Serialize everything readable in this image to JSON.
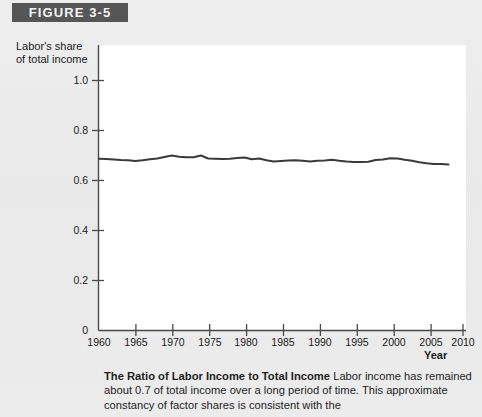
{
  "figure": {
    "banner_label": "FIGURE 3-5"
  },
  "axes": {
    "y_title_line1": "Labor's share",
    "y_title_line2": "of total income",
    "x_title": "Year",
    "y_ticks": [
      "1.0",
      "0.8",
      "0.6",
      "0.4",
      "0.2",
      "0"
    ],
    "x_ticks": [
      "1960",
      "1965",
      "1970",
      "1975",
      "1980",
      "1985",
      "1990",
      "1995",
      "2000",
      "2005",
      "2010"
    ]
  },
  "caption": {
    "title": "The Ratio of Labor Income to Total Income",
    "body": "Labor income has remained about 0.7 of total income over a long period of time. This approximate constancy of factor shares is consistent with the"
  },
  "colors": {
    "banner_bg": "#565656",
    "banner_text": "#f4f4f4",
    "page_bg": "#ebebeb",
    "plot_bg": "#ffffff",
    "line": "#3a3a3a",
    "axis": "#4a4a4a"
  },
  "chart_data": {
    "type": "line",
    "title": "The Ratio of Labor Income to Total Income",
    "xlabel": "Year",
    "ylabel": "Labor's share of total income",
    "xlim": [
      1960,
      2010
    ],
    "ylim": [
      0,
      1.0
    ],
    "yticks": [
      0,
      0.2,
      0.4,
      0.6,
      0.8,
      1.0
    ],
    "xticks": [
      1960,
      1965,
      1970,
      1975,
      1980,
      1985,
      1990,
      1995,
      2000,
      2005,
      2010
    ],
    "grid": false,
    "legend": "none",
    "series": [
      {
        "name": "Labor's share of total income",
        "x": [
          1960,
          1961,
          1962,
          1963,
          1964,
          1965,
          1966,
          1967,
          1968,
          1969,
          1970,
          1971,
          1972,
          1973,
          1974,
          1975,
          1976,
          1977,
          1978,
          1979,
          1980,
          1981,
          1982,
          1983,
          1984,
          1985,
          1986,
          1987,
          1988,
          1989,
          1990,
          1991,
          1992,
          1993,
          1994,
          1995,
          1996,
          1997,
          1998,
          1999,
          2000,
          2001,
          2002,
          2003,
          2004,
          2005,
          2006,
          2007,
          2008
        ],
        "values": [
          0.687,
          0.686,
          0.684,
          0.682,
          0.681,
          0.678,
          0.681,
          0.685,
          0.688,
          0.694,
          0.7,
          0.695,
          0.693,
          0.693,
          0.7,
          0.688,
          0.687,
          0.686,
          0.687,
          0.69,
          0.692,
          0.685,
          0.688,
          0.681,
          0.676,
          0.678,
          0.68,
          0.681,
          0.679,
          0.676,
          0.679,
          0.68,
          0.683,
          0.679,
          0.676,
          0.674,
          0.674,
          0.675,
          0.682,
          0.684,
          0.689,
          0.688,
          0.683,
          0.679,
          0.673,
          0.669,
          0.666,
          0.666,
          0.664
        ]
      }
    ],
    "annotation": "Labor income has remained about 0.7 of total income over a long period of time."
  }
}
